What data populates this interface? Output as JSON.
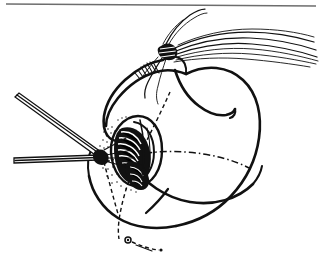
{
  "figure": {
    "domain_kind": "medical-illustration",
    "caption": "",
    "background_color": "#ffffff",
    "ink_color": "#111111",
    "rule_color": "#6d6d6d",
    "canvas": {
      "width": 321,
      "height": 264
    }
  },
  "header_rule": {
    "label": "horizontal rule",
    "x1": 6,
    "y1": 4,
    "x2": 316,
    "y2": 6,
    "color": "#6d6d6d"
  },
  "elements": [
    {
      "id": "organ-body",
      "label": "organ body outline",
      "kind": "outline",
      "description": "large rounded anatomical body occupying the centre-right of the frame"
    },
    {
      "id": "organ-upper-lobe",
      "label": "upper lobe",
      "kind": "outline",
      "description": "superior lobe folding over toward the upper left"
    },
    {
      "id": "organ-lower-lobe",
      "label": "lower lobe",
      "kind": "outline",
      "description": "inferior lobe curving beneath the body"
    },
    {
      "id": "incision-opening",
      "label": "incision opening",
      "kind": "aperture",
      "description": "dark elliptical opening with internal shading at the centre-left of the organ"
    },
    {
      "id": "suture-bundle",
      "label": "suture thread bundle",
      "kind": "threads",
      "count": 9,
      "description": "bundle of suture strands fanning to the upper-right from a knot"
    },
    {
      "id": "suture-knot",
      "label": "suture knot",
      "kind": "knot",
      "description": "tight knot where the suture strands converge"
    },
    {
      "id": "forceps-upper",
      "label": "upper forceps shaft",
      "kind": "instrument",
      "description": "slender instrument shaft entering diagonally from the upper left"
    },
    {
      "id": "forceps-lower",
      "label": "lower forceps shaft",
      "kind": "instrument",
      "description": "slender instrument shaft entering horizontally from the left"
    },
    {
      "id": "forceps-tip",
      "label": "forceps tip",
      "kind": "instrument",
      "description": "convergent tip of the two shafts at the incision margin"
    },
    {
      "id": "centerline",
      "label": "dash-dot reference line",
      "kind": "guide",
      "description": "dash-dot line crossing the organ horizontally as an anatomical reference plane"
    },
    {
      "id": "guide-diagonal",
      "label": "dashed guide line",
      "kind": "guide",
      "description": "dashed line running from the upper area down through the lower-left of the organ"
    },
    {
      "id": "marker-node",
      "label": "reference node marker",
      "kind": "marker",
      "description": "small circular node with a short dashed tail near the lower margin"
    },
    {
      "id": "stipple-field",
      "label": "stippled shading",
      "kind": "texture",
      "description": "dotted stipple texture radiating from the forceps tip across the tissue surface"
    }
  ],
  "labels": {
    "visible_text": []
  }
}
